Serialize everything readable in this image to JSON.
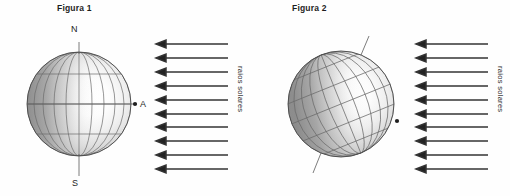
{
  "document": {
    "kind": "scanned-textbook-figure",
    "background_color": "#fefefe",
    "ink_color": "#2a2a2a"
  },
  "figures": [
    {
      "id": "figura-1",
      "title": "Figura 1",
      "globe": {
        "axis_tilt_degrees": 0,
        "description": "Esfera terrestre com eixo vertical",
        "center_x": 79,
        "center_y": 104,
        "radius": 52,
        "shading": "terminador vertical, sombra a esquerda",
        "latitude_line_count": 5,
        "meridian_count": 9,
        "pole_north_label": "N",
        "pole_south_label": "S",
        "point_label": "A",
        "point_label_italic": false,
        "pole_label_italic": false
      },
      "rays": {
        "label": "raios solares",
        "count": 10,
        "direction": "left",
        "color": "#333333",
        "first_y": 44,
        "spacing": 14,
        "length": 66
      }
    },
    {
      "id": "figura-2",
      "title": "Figura 2",
      "globe": {
        "axis_tilt_degrees": 23.5,
        "description": "Esfera terrestre com eixo inclinado",
        "center_x": 86,
        "center_y": 104,
        "radius": 53,
        "shading": "terminador inclinado, sombra a esquerda",
        "latitude_line_count": 5,
        "meridian_count": 9,
        "pole_north_label": "N",
        "pole_south_label": "S",
        "point_label": "A",
        "point_label_italic": false,
        "pole_label_italic": true
      },
      "rays": {
        "label": "raios solares",
        "count": 10,
        "direction": "left",
        "color": "#333333",
        "first_y": 44,
        "spacing": 14,
        "length": 66
      }
    }
  ],
  "colors": {
    "shadow_dark": "#8d8d8d",
    "shadow_mid": "#bdbdbd",
    "highlight": "#ffffff",
    "grid_line": "#6e6e6e",
    "outline": "#4a4a4a",
    "arrow": "#333333",
    "text": "#242424"
  }
}
